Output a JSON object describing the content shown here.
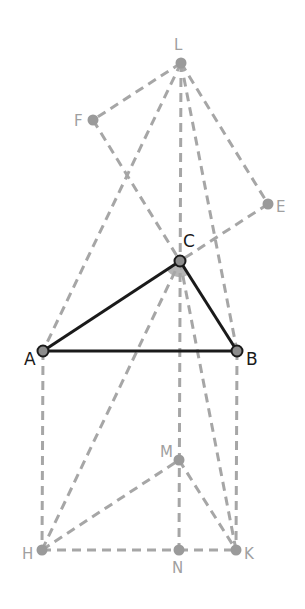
{
  "diagram": {
    "title": "",
    "points": [
      {
        "id": "A",
        "label": "A",
        "kind": "main"
      },
      {
        "id": "B",
        "label": "B",
        "kind": "main"
      },
      {
        "id": "C",
        "label": "C",
        "kind": "main"
      },
      {
        "id": "L",
        "label": "L",
        "kind": "aux"
      },
      {
        "id": "F",
        "label": "F",
        "kind": "aux"
      },
      {
        "id": "E",
        "label": "E",
        "kind": "aux"
      },
      {
        "id": "M",
        "label": "M",
        "kind": "aux"
      },
      {
        "id": "H",
        "label": "H",
        "kind": "aux"
      },
      {
        "id": "N",
        "label": "N",
        "kind": "aux"
      },
      {
        "id": "K",
        "label": "K",
        "kind": "aux"
      }
    ],
    "solid_segments": [
      [
        "A",
        "B"
      ],
      [
        "B",
        "C"
      ],
      [
        "C",
        "A"
      ]
    ],
    "dashed_segments": [
      [
        "L",
        "F"
      ],
      [
        "F",
        "C"
      ],
      [
        "C",
        "K"
      ],
      [
        "L",
        "E"
      ],
      [
        "E",
        "C"
      ],
      [
        "L",
        "A"
      ],
      [
        "L",
        "N"
      ],
      [
        "L",
        "B"
      ],
      [
        "A",
        "H"
      ],
      [
        "B",
        "K"
      ],
      [
        "H",
        "N"
      ],
      [
        "N",
        "K"
      ],
      [
        "H",
        "M"
      ],
      [
        "M",
        "K"
      ],
      [
        "H",
        "C"
      ]
    ],
    "angle_mark": {
      "vertex": "C",
      "between": [
        "A",
        "B"
      ]
    },
    "colors": {
      "solid": "#1a1a1a",
      "dashed": "#a6a6a6",
      "label_main": "#1a1a1a",
      "label_aux": "#a0a0a0"
    }
  }
}
